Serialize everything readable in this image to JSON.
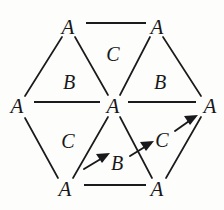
{
  "figure": {
    "kind": "hexagonal-lattice-diagram",
    "background_color": "#fdfdfc",
    "ink_color": "#18181a",
    "width": 224,
    "height": 210
  },
  "vertices": [
    {
      "id": "top-left",
      "label": "A",
      "x": 68,
      "y": 27
    },
    {
      "id": "top-right",
      "label": "A",
      "x": 157,
      "y": 27
    },
    {
      "id": "mid-left",
      "label": "A",
      "x": 17,
      "y": 106
    },
    {
      "id": "center",
      "label": "A",
      "x": 113,
      "y": 106
    },
    {
      "id": "mid-right",
      "label": "A",
      "x": 209,
      "y": 106
    },
    {
      "id": "bottom-left",
      "label": "A",
      "x": 65,
      "y": 189
    },
    {
      "id": "bottom-right",
      "label": "A",
      "x": 157,
      "y": 189
    }
  ],
  "faces": [
    {
      "id": "face-top-center",
      "label": "C",
      "x": 113,
      "y": 54
    },
    {
      "id": "face-upper-left",
      "label": "B",
      "x": 69,
      "y": 82
    },
    {
      "id": "face-upper-right",
      "label": "B",
      "x": 160,
      "y": 82
    },
    {
      "id": "face-lower-left",
      "label": "C",
      "x": 68,
      "y": 141
    },
    {
      "id": "face-lower-center",
      "label": "B",
      "x": 117,
      "y": 163
    },
    {
      "id": "face-lower-right",
      "label": "C",
      "x": 162,
      "y": 140
    }
  ],
  "edges": [
    {
      "id": "edge-top",
      "from": "top-left",
      "to": "top-right",
      "style": "horizontal"
    },
    {
      "id": "edge-mid",
      "from": "mid-left",
      "to": "center",
      "style": "horizontal"
    },
    {
      "id": "edge-mid-right",
      "from": "center",
      "to": "mid-right",
      "style": "horizontal"
    },
    {
      "id": "edge-bottom",
      "from": "bottom-left",
      "to": "bottom-right",
      "style": "horizontal"
    },
    {
      "id": "edge-topleft-midleft",
      "from": "top-left",
      "to": "mid-left",
      "style": "diagonal"
    },
    {
      "id": "edge-topleft-center",
      "from": "top-left",
      "to": "center",
      "style": "diagonal"
    },
    {
      "id": "edge-topright-center",
      "from": "top-right",
      "to": "center",
      "style": "diagonal"
    },
    {
      "id": "edge-topright-midright",
      "from": "top-right",
      "to": "mid-right",
      "style": "diagonal"
    },
    {
      "id": "edge-midleft-bottomleft",
      "from": "mid-left",
      "to": "bottom-left",
      "style": "diagonal"
    },
    {
      "id": "edge-center-bottomleft",
      "from": "center",
      "to": "bottom-left",
      "style": "diagonal"
    },
    {
      "id": "edge-center-bottomright",
      "from": "center",
      "to": "bottom-right",
      "style": "diagonal"
    },
    {
      "id": "edge-midright-bottomright",
      "from": "mid-right",
      "to": "bottom-right",
      "style": "diagonal"
    }
  ],
  "annotation_arrows": [
    {
      "id": "arrow-toward-lower-center-b",
      "points_to": "face-lower-center",
      "x1": 85,
      "y1": 168,
      "x2": 108,
      "y2": 155
    },
    {
      "id": "arrow-toward-lower-right-c",
      "points_to": "face-lower-right",
      "x1": 131,
      "y1": 155,
      "x2": 152,
      "y2": 143
    },
    {
      "id": "arrow-toward-mid-right-vertex",
      "points_to": "mid-right",
      "x1": 176,
      "y1": 130,
      "x2": 196,
      "y2": 116
    }
  ]
}
